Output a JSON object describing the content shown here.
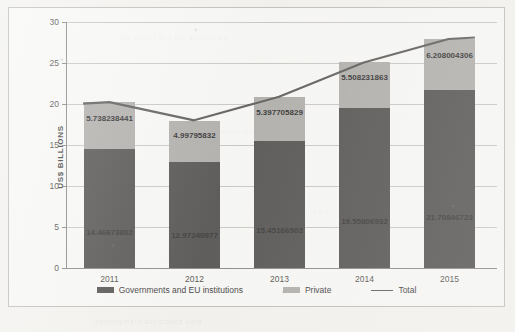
{
  "chart_data": {
    "type": "bar",
    "stacked": true,
    "title": "",
    "xlabel": "",
    "ylabel": "US$ BILLIONS",
    "ylim": [
      0,
      30
    ],
    "yticks": [
      0,
      5,
      10,
      15,
      20,
      25,
      30
    ],
    "grid": true,
    "legend_position": "bottom",
    "categories": [
      "2011",
      "2012",
      "2013",
      "2014",
      "2015"
    ],
    "series": [
      {
        "name": "Governments and EU institutions",
        "type": "bar",
        "color": "#3f3e3d",
        "values": [
          14.46673802,
          12.97240977,
          15.45166902,
          19.55806932,
          21.70846723
        ],
        "labels": [
          "14.46673802",
          "12.97240977",
          "15.45166902",
          "19.55806932",
          "21.70846723"
        ]
      },
      {
        "name": "Private",
        "type": "bar",
        "color": "#a6a5a2",
        "values": [
          5.738238441,
          4.99795832,
          5.397705829,
          5.508231863,
          6.208004306
        ],
        "labels": [
          "5.738238441",
          "4.99795832",
          "5.397705829",
          "5.508231863",
          "6.208004306"
        ]
      },
      {
        "name": "Total",
        "type": "line",
        "color": "#4a4947",
        "values": [
          20.20497646,
          17.97036809,
          20.84937485,
          25.06630118,
          27.91647154
        ],
        "labels": [
          "",
          "",
          "",
          "",
          ""
        ]
      }
    ]
  },
  "ghost_text": [
    "the report and the associated",
    "funding levels for research",
    "in the european region",
    "development assistance data"
  ]
}
